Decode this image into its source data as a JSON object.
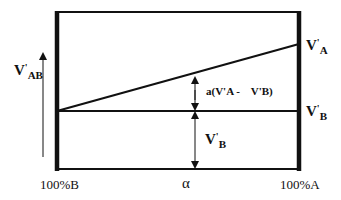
{
  "diagram": {
    "type": "voltage-vs-composition",
    "y_axis_label": {
      "main": "V",
      "prime": "'",
      "sub": "AB"
    },
    "x_axis": {
      "left_label": "100%B",
      "center_label": "α",
      "right_label": "100%A"
    },
    "lines": [
      {
        "name": "V'A line",
        "label": {
          "main": "V",
          "prime": "'",
          "sub": "A"
        }
      },
      {
        "name": "V'B line",
        "label": {
          "main": "V",
          "prime": "'",
          "sub": "B"
        }
      }
    ],
    "annotations": {
      "difference": "a(V'A -    V'B)",
      "baseline": {
        "main": "V",
        "prime": "'",
        "sub": "B"
      }
    },
    "colors": {
      "stroke": "#111111",
      "background": "#ffffff"
    }
  }
}
